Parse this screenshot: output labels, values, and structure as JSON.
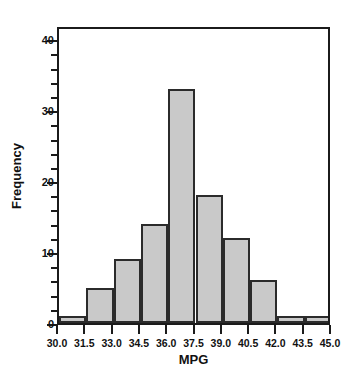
{
  "chart_data": {
    "type": "bar",
    "title": "",
    "subtitle": "",
    "xlabel": "MPG",
    "ylabel": "Frequency",
    "bin_width": 1.5,
    "xlim": [
      30.0,
      45.0
    ],
    "ylim": [
      0,
      42
    ],
    "grid": false,
    "legend": null,
    "bar_fill_color": "#c9c9c9",
    "bar_edge_color": "#2b2b2b",
    "axis_color": "#1b1b1b",
    "background_color": "#ffffff",
    "categories": [
      "30.0-31.5",
      "31.5-33.0",
      "33.0-34.5",
      "34.5-36.0",
      "36.0-37.5",
      "37.5-39.0",
      "39.0-40.5",
      "40.5-42.0",
      "42.0-43.5",
      "43.5-45.0"
    ],
    "bin_edges": [
      30.0,
      31.5,
      33.0,
      34.5,
      36.0,
      37.5,
      39.0,
      40.5,
      42.0,
      43.5,
      45.0
    ],
    "values": [
      1,
      5,
      9,
      14,
      33,
      18,
      12,
      6,
      1,
      1
    ],
    "x_tick_labels": [
      "30.0",
      "31.5",
      "33.0",
      "34.5",
      "36.0",
      "37.5",
      "39.0",
      "40.5",
      "42.0",
      "43.5",
      "45.0"
    ],
    "x_tick_values": [
      30.0,
      31.5,
      33.0,
      34.5,
      36.0,
      37.5,
      39.0,
      40.5,
      42.0,
      43.5,
      45.0
    ],
    "y_tick_labels": [
      "0",
      "10",
      "20",
      "30",
      "40"
    ],
    "y_tick_values": [
      0,
      10,
      20,
      30,
      40
    ],
    "y_minor_tick_values": [
      2,
      4,
      6,
      8,
      12,
      14,
      16,
      18,
      22,
      24,
      26,
      28,
      32,
      34,
      36,
      38
    ]
  }
}
